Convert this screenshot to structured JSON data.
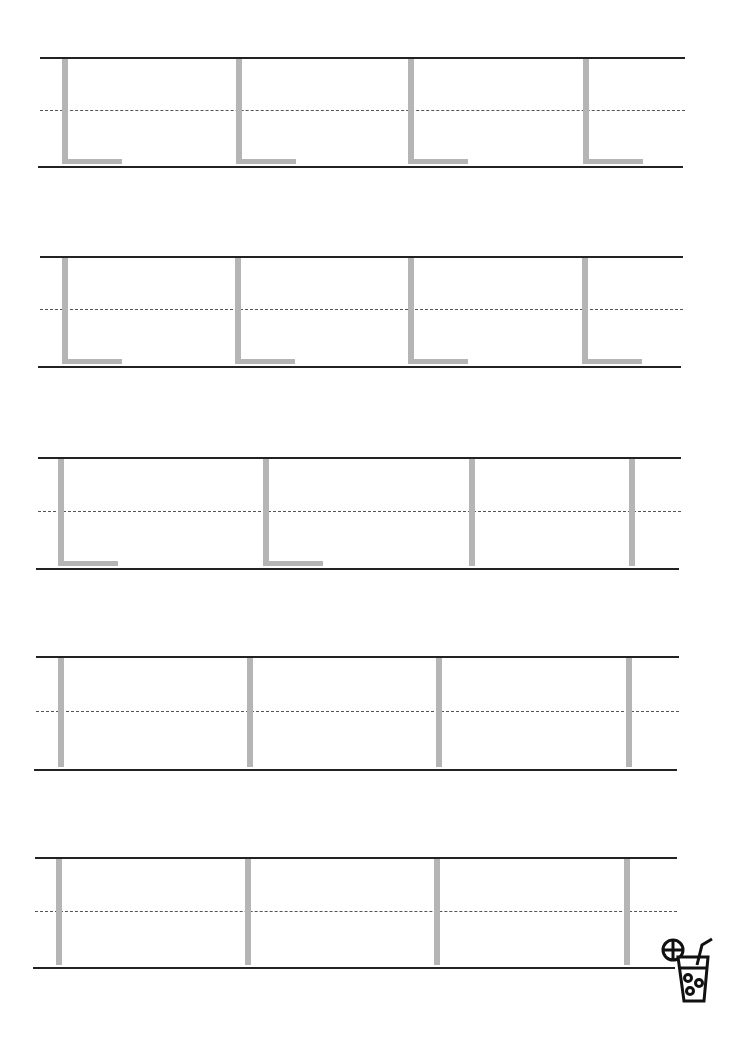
{
  "worksheet": {
    "title": "Letter L tracing practice",
    "colors": {
      "guide_line": "#222222",
      "dashed_midline": "#555555",
      "trace_glyph": "#b5b5b5"
    },
    "rows": [
      {
        "top": 57,
        "bottom": 166,
        "mid": 110,
        "left": 40,
        "right": 685,
        "glyphs": [
          {
            "char": "L",
            "x": 62
          },
          {
            "char": "L",
            "x": 236
          },
          {
            "char": "L",
            "x": 408
          },
          {
            "char": "L",
            "x": 583
          }
        ]
      },
      {
        "top": 256,
        "bottom": 366,
        "mid": 309,
        "left": 40,
        "right": 683,
        "glyphs": [
          {
            "char": "L",
            "x": 62
          },
          {
            "char": "L",
            "x": 235
          },
          {
            "char": "L",
            "x": 408
          },
          {
            "char": "L",
            "x": 582
          }
        ]
      },
      {
        "top": 457,
        "bottom": 568,
        "mid": 511,
        "left": 38,
        "right": 681,
        "glyphs": [
          {
            "char": "L",
            "x": 58
          },
          {
            "char": "L",
            "x": 263
          },
          {
            "char": "l",
            "x": 469
          },
          {
            "char": "l",
            "x": 629
          }
        ]
      },
      {
        "top": 656,
        "bottom": 769,
        "mid": 711,
        "left": 36,
        "right": 679,
        "glyphs": [
          {
            "char": "l",
            "x": 58
          },
          {
            "char": "l",
            "x": 247
          },
          {
            "char": "l",
            "x": 436
          },
          {
            "char": "l",
            "x": 626
          }
        ]
      },
      {
        "top": 857,
        "bottom": 967,
        "mid": 911,
        "left": 35,
        "right": 677,
        "glyphs": [
          {
            "char": "l",
            "x": 56
          },
          {
            "char": "l",
            "x": 245
          },
          {
            "char": "l",
            "x": 434
          },
          {
            "char": "l",
            "x": 624
          }
        ]
      }
    ],
    "decoration": {
      "icon": "drink-glass-icon"
    }
  }
}
